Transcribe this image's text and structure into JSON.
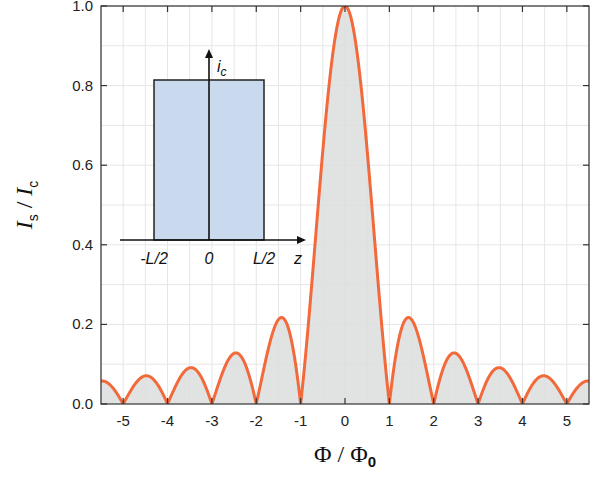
{
  "chart_data": {
    "type": "line",
    "title": "",
    "function": "|sin(pi*x)/(pi*x)|",
    "xlabel": "Φ / Φ0",
    "xlabel_main": "Φ / Φ",
    "xlabel_sub": "0",
    "ylabel": "I_s / I_c",
    "ylabel_main_1": "I",
    "ylabel_sub_1": "s",
    "ylabel_sep": " / ",
    "ylabel_main_2": "I",
    "ylabel_sub_2": "c",
    "xlim": [
      -5.5,
      5.5
    ],
    "ylim": [
      0.0,
      1.0
    ],
    "grid": true,
    "x_ticks": [
      -5,
      -4,
      -3,
      -2,
      -1,
      0,
      1,
      2,
      3,
      4,
      5
    ],
    "x_tick_labels": [
      "-5",
      "-4",
      "-3",
      "-2",
      "-1",
      "0",
      "1",
      "2",
      "3",
      "4",
      "5"
    ],
    "y_ticks": [
      0.0,
      0.2,
      0.4,
      0.6,
      0.8,
      1.0
    ],
    "y_tick_labels": [
      "0.0",
      "0.2",
      "0.4",
      "0.6",
      "0.8",
      "1.0"
    ],
    "series": [
      {
        "name": "Fraunhofer pattern",
        "color": "#f26a3b",
        "fill": "#dcdedd",
        "peaks": [
          {
            "x": -4.5,
            "y": 0.071
          },
          {
            "x": -3.5,
            "y": 0.091
          },
          {
            "x": -2.5,
            "y": 0.127
          },
          {
            "x": -1.43,
            "y": 0.217
          },
          {
            "x": 0.0,
            "y": 1.0
          },
          {
            "x": 1.43,
            "y": 0.217
          },
          {
            "x": 2.46,
            "y": 0.128
          },
          {
            "x": 3.47,
            "y": 0.091
          },
          {
            "x": 4.48,
            "y": 0.071
          }
        ],
        "zeros": [
          -5,
          -4,
          -3,
          -2,
          -1,
          1,
          2,
          3,
          4,
          5
        ]
      }
    ],
    "inset": {
      "type": "rectangular current distribution",
      "y_axis_label": "i",
      "y_axis_sub": "c",
      "x_axis_label": "z",
      "x_tick_labels": [
        "-L/2",
        "0",
        "L/2"
      ],
      "box_fill": "#c9d9ee",
      "box_stroke": "#222222"
    }
  }
}
